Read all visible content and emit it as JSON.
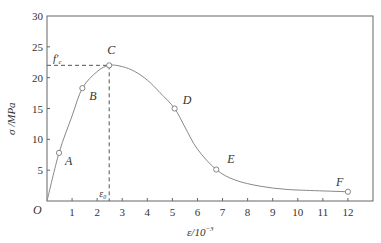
{
  "chart_data": {
    "type": "line",
    "title": "",
    "xlabel": "ε/10⁻³",
    "ylabel": "σ/MPa",
    "xlim": [
      0,
      13
    ],
    "ylim": [
      0,
      30
    ],
    "xticks": [
      1,
      2,
      3,
      4,
      5,
      6,
      7,
      8,
      9,
      10,
      11,
      12
    ],
    "yticks": [
      5,
      10,
      15,
      20,
      25,
      30
    ],
    "origin_label": "O",
    "grid": false,
    "legend": null,
    "series": [
      {
        "name": "stress-strain curve",
        "color": "#888888",
        "x": [
          0,
          0.48,
          1.0,
          1.41,
          2.0,
          2.48,
          3.0,
          3.5,
          4.0,
          4.5,
          5.09,
          5.5,
          6.0,
          6.75,
          7.5,
          8.5,
          9.5,
          10.5,
          12.0
        ],
        "y": [
          0,
          7.8,
          13.8,
          18.3,
          21.0,
          22.0,
          21.8,
          21.0,
          19.6,
          17.6,
          15.0,
          12.0,
          8.4,
          5.1,
          3.4,
          2.4,
          1.9,
          1.7,
          1.5
        ]
      }
    ],
    "key_points": [
      {
        "label": "A",
        "x": 0.48,
        "y": 7.8
      },
      {
        "label": "B",
        "x": 1.41,
        "y": 18.3
      },
      {
        "label": "C",
        "x": 2.48,
        "y": 22.0
      },
      {
        "label": "D",
        "x": 5.09,
        "y": 15.0
      },
      {
        "label": "E",
        "x": 6.75,
        "y": 5.1
      },
      {
        "label": "F",
        "x": 12.0,
        "y": 1.5
      }
    ],
    "annotations": [
      {
        "text": "f′c",
        "type": "peak-stress",
        "y": 22.0,
        "style": "dashed horizontal line to y-axis"
      },
      {
        "text": "ε₀",
        "type": "peak-strain",
        "x": 2.48,
        "style": "dashed vertical line to x-axis"
      }
    ]
  }
}
